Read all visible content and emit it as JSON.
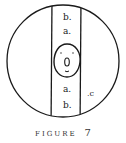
{
  "figure": {
    "caption_word": "FIGURE",
    "caption_number": "7",
    "labels": {
      "top_outer": "b.",
      "top_inner": "a.",
      "bottom_inner": "a.",
      "bottom_outer": "b.",
      "side": ".c"
    },
    "colors": {
      "stroke": "#1a1a1a",
      "background": "#ffffff"
    }
  }
}
